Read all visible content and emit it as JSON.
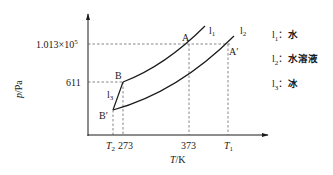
{
  "diagram": {
    "type": "phase-diagram",
    "axes": {
      "y_label": "p/Pa",
      "x_label": "T/K",
      "y_ticks": [
        "611",
        "1.013×10⁵"
      ],
      "y_tick_main": "1.013×10",
      "y_tick_exp": "5",
      "x_ticks": [
        "T2",
        "273",
        "373",
        "T1"
      ]
    },
    "x_tick_labels": {
      "T2_base": "T",
      "T2_sub": "2",
      "t273": "273",
      "t373": "373",
      "T1_base": "T",
      "T1_sub": "1"
    },
    "points": {
      "A": "A",
      "A_prime": "A′",
      "B": "B",
      "B_prime": "B′"
    },
    "curve_labels": {
      "l1": {
        "base": "l",
        "sub": "1"
      },
      "l2": {
        "base": "l",
        "sub": "2"
      },
      "l3": {
        "base": "l",
        "sub": "3"
      }
    },
    "legend": [
      {
        "sym": "l",
        "sub": "1",
        "sep": "：",
        "text": "水"
      },
      {
        "sym": "l",
        "sub": "2",
        "sep": "：",
        "text": "水溶液"
      },
      {
        "sym": "l",
        "sub": "3",
        "sep": "：",
        "text": "冰"
      }
    ],
    "colors": {
      "line": "#1a1a1a",
      "dash": "#555555"
    }
  }
}
